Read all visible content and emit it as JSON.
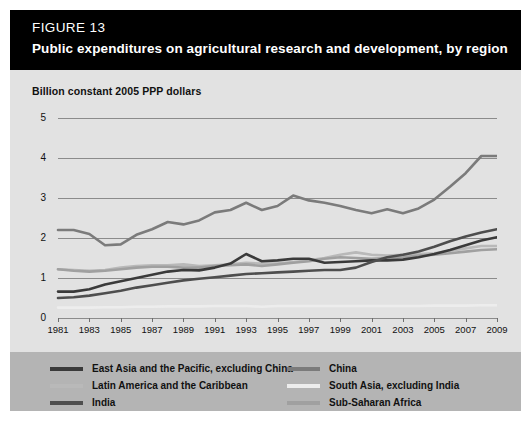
{
  "header": {
    "figure_label": "FIGURE 13",
    "title": "Public expenditures on agricultural research and development, by region"
  },
  "chart_data": {
    "type": "line",
    "title": "Public expenditures on agricultural research and development, by region",
    "subtitle": "FIGURE 13",
    "ylabel": "Billion constant 2005 PPP dollars",
    "xlabel": "",
    "ylim": [
      0,
      5
    ],
    "xlim": [
      1981,
      2009
    ],
    "yticks": [
      0,
      1,
      2,
      3,
      4,
      5
    ],
    "ytick_labels": [
      "0",
      "1",
      "2",
      "3",
      "4",
      "5"
    ],
    "xticks": [
      1981,
      1983,
      1985,
      1987,
      1989,
      1991,
      1993,
      1995,
      1997,
      1999,
      2001,
      2003,
      2005,
      2007,
      2009
    ],
    "xtick_labels": [
      "1981",
      "1983",
      "1985",
      "1987",
      "1989",
      "1991",
      "1993",
      "1995",
      "1997",
      "1999",
      "2001",
      "2003",
      "2005",
      "2007",
      "2009"
    ],
    "grid": "horizontal",
    "legend_position": "bottom",
    "x": [
      1981,
      1982,
      1983,
      1984,
      1985,
      1986,
      1987,
      1988,
      1989,
      1990,
      1991,
      1992,
      1993,
      1994,
      1995,
      1996,
      1997,
      1998,
      1999,
      2000,
      2001,
      2002,
      2003,
      2004,
      2005,
      2006,
      2007,
      2008,
      2009
    ],
    "series": [
      {
        "name": "East Asia and the Pacific, excluding China",
        "color": "#3a3a3a",
        "values": [
          0.66,
          0.66,
          0.72,
          0.84,
          0.92,
          1.0,
          1.08,
          1.16,
          1.2,
          1.19,
          1.26,
          1.36,
          1.6,
          1.42,
          1.44,
          1.48,
          1.48,
          1.38,
          1.4,
          1.42,
          1.44,
          1.44,
          1.46,
          1.52,
          1.6,
          1.7,
          1.82,
          1.94,
          2.02
        ]
      },
      {
        "name": "China",
        "color": "#7b7b7b",
        "values": [
          2.2,
          2.2,
          2.1,
          1.82,
          1.84,
          2.08,
          2.22,
          2.4,
          2.34,
          2.44,
          2.64,
          2.7,
          2.88,
          2.7,
          2.8,
          3.06,
          2.94,
          2.88,
          2.8,
          2.7,
          2.62,
          2.72,
          2.62,
          2.74,
          2.96,
          3.28,
          3.62,
          4.05,
          4.05
        ]
      },
      {
        "name": "Latin America and the Caribbean",
        "color": "#b9b9b9",
        "values": [
          1.22,
          1.2,
          1.18,
          1.2,
          1.26,
          1.3,
          1.32,
          1.32,
          1.34,
          1.3,
          1.32,
          1.34,
          1.38,
          1.36,
          1.36,
          1.4,
          1.44,
          1.5,
          1.58,
          1.64,
          1.58,
          1.56,
          1.58,
          1.6,
          1.62,
          1.68,
          1.74,
          1.8,
          1.8
        ]
      },
      {
        "name": "South Asia, excluding India",
        "color": "#ededed",
        "values": [
          0.26,
          0.26,
          0.26,
          0.27,
          0.27,
          0.28,
          0.28,
          0.29,
          0.29,
          0.29,
          0.3,
          0.3,
          0.3,
          0.28,
          0.3,
          0.3,
          0.3,
          0.3,
          0.3,
          0.3,
          0.3,
          0.3,
          0.3,
          0.3,
          0.31,
          0.31,
          0.31,
          0.32,
          0.32
        ]
      },
      {
        "name": "India",
        "color": "#4e4e4e",
        "values": [
          0.5,
          0.52,
          0.56,
          0.62,
          0.68,
          0.76,
          0.82,
          0.88,
          0.94,
          0.98,
          1.02,
          1.06,
          1.1,
          1.12,
          1.14,
          1.16,
          1.18,
          1.2,
          1.2,
          1.26,
          1.4,
          1.52,
          1.58,
          1.66,
          1.78,
          1.92,
          2.04,
          2.14,
          2.22
        ]
      },
      {
        "name": "Sub-Saharan Africa",
        "color": "#a0a0a0",
        "values": [
          1.22,
          1.18,
          1.16,
          1.18,
          1.22,
          1.26,
          1.28,
          1.28,
          1.26,
          1.26,
          1.3,
          1.32,
          1.34,
          1.3,
          1.34,
          1.38,
          1.42,
          1.48,
          1.52,
          1.5,
          1.48,
          1.5,
          1.52,
          1.56,
          1.58,
          1.62,
          1.66,
          1.7,
          1.72
        ]
      }
    ],
    "legend": [
      {
        "label": "East Asia and the Pacific, excluding China",
        "color": "#3a3a3a"
      },
      {
        "label": "China",
        "color": "#7b7b7b"
      },
      {
        "label": "Latin America and the Caribbean",
        "color": "#b9b9b9"
      },
      {
        "label": "South Asia, excluding India",
        "color": "#ededed"
      },
      {
        "label": "India",
        "color": "#4e4e4e"
      },
      {
        "label": "Sub-Saharan Africa",
        "color": "#a0a0a0"
      }
    ]
  }
}
